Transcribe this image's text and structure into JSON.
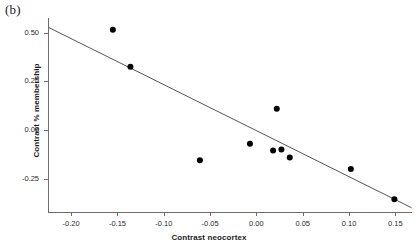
{
  "figure": {
    "panel_label": "(b)",
    "background_color": "#ffffff",
    "point_color": "#000000",
    "line_color": "#555555",
    "axis_color": "#6e6e6e"
  },
  "chart_data": {
    "type": "scatter",
    "title": "",
    "subtitle": "",
    "xlabel": "Contrast neocortex",
    "ylabel": "Contrast % membership",
    "xlim": [
      -0.225,
      0.168
    ],
    "ylim": [
      -0.42,
      0.575
    ],
    "grid": false,
    "legend": null,
    "xticks": [
      -0.2,
      -0.15,
      -0.1,
      -0.05,
      0.0,
      0.05,
      0.1,
      0.15
    ],
    "xticklabels": [
      "-0.20",
      "-0.15",
      "-0.10",
      "-0.05",
      "0.00",
      "0.05",
      "0.10",
      "0.15"
    ],
    "yticks": [
      0.5,
      0.25,
      0.0,
      -0.25
    ],
    "yticklabels": [
      "0.50",
      "0.25",
      "0.00",
      "-0.25"
    ],
    "points": [
      {
        "x": -0.155,
        "y": 0.515
      },
      {
        "x": -0.136,
        "y": 0.325
      },
      {
        "x": -0.061,
        "y": -0.155
      },
      {
        "x": -0.007,
        "y": -0.07
      },
      {
        "x": 0.022,
        "y": 0.11
      },
      {
        "x": 0.018,
        "y": -0.105
      },
      {
        "x": 0.027,
        "y": -0.1
      },
      {
        "x": 0.036,
        "y": -0.14
      },
      {
        "x": 0.102,
        "y": -0.2
      },
      {
        "x": 0.149,
        "y": -0.355
      }
    ],
    "series": [
      {
        "name": "observations",
        "type": "scatter",
        "marker": "filled-circle",
        "values": [
          {
            "x": -0.155,
            "y": 0.515
          },
          {
            "x": -0.136,
            "y": 0.325
          },
          {
            "x": -0.061,
            "y": -0.155
          },
          {
            "x": -0.007,
            "y": -0.07
          },
          {
            "x": 0.022,
            "y": 0.11
          },
          {
            "x": 0.018,
            "y": -0.105
          },
          {
            "x": 0.027,
            "y": -0.1
          },
          {
            "x": 0.036,
            "y": -0.14
          },
          {
            "x": 0.102,
            "y": -0.2
          },
          {
            "x": 0.149,
            "y": -0.355
          }
        ]
      },
      {
        "name": "regression-line",
        "type": "line",
        "endpoints": [
          {
            "x": -0.2245,
            "y": 0.527
          },
          {
            "x": 0.1675,
            "y": -0.398
          }
        ]
      }
    ]
  }
}
